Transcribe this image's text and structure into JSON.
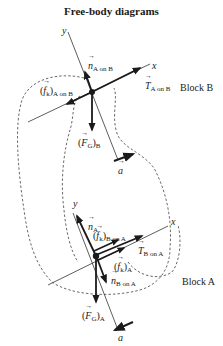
{
  "title": "Free-body diagrams",
  "colors": {
    "ink": "#1a1a1a",
    "axis": "#333333",
    "dashed": "#444444",
    "background": "#ffffff"
  },
  "block_b": {
    "label": "Block B",
    "axis_x": "x",
    "axis_y": "y",
    "forces": {
      "normal": {
        "symbol": "n",
        "sub": "A on B"
      },
      "tension": {
        "symbol": "T",
        "sub": "A on B"
      },
      "friction": {
        "prefix": "(",
        "symbol": "f",
        "ksub": "k",
        "suffix": ")",
        "sub": "A on B"
      },
      "gravity": {
        "prefix": "(",
        "symbol": "F",
        "gsub": "G",
        "suffix": ")",
        "sub": "B"
      }
    },
    "acceleration": {
      "symbol": "a"
    }
  },
  "block_a": {
    "label": "Block A",
    "axis_x": "x",
    "axis_y": "y",
    "forces": {
      "normal": {
        "symbol": "n",
        "sub": "A"
      },
      "friction_b_on_a": {
        "prefix": "(",
        "symbol": "f",
        "ksub": "k",
        "suffix": ")",
        "sub": "B on A"
      },
      "tension": {
        "symbol": "T",
        "sub": "B on A"
      },
      "friction_a": {
        "prefix": "(",
        "symbol": "f",
        "ksub": "k",
        "suffix": ")",
        "sub": "A"
      },
      "normal_b_on_a": {
        "symbol": "n",
        "sub": "B on A"
      },
      "gravity": {
        "prefix": "(",
        "symbol": "F",
        "gsub": "G",
        "suffix": ")",
        "sub": "A"
      }
    },
    "acceleration": {
      "symbol": "a"
    }
  }
}
